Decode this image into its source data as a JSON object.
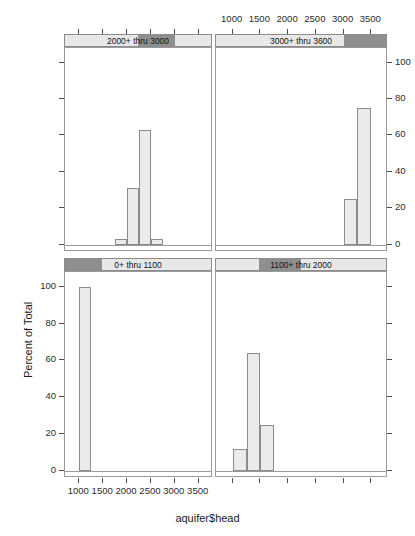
{
  "chart_data": {
    "type": "bar",
    "title": "",
    "xlabel": "aquifer$head",
    "ylabel": "Percent of Total",
    "layout": "lattice conditioned histogram, 2 rows x 2 columns",
    "xlim": [
      700,
      3800
    ],
    "ylim": [
      -4,
      108
    ],
    "xticks": [
      1000,
      1500,
      2000,
      2500,
      3000,
      3500
    ],
    "yticks": [
      0,
      20,
      40,
      60,
      80,
      100
    ],
    "grid": false,
    "legend": "none",
    "bin_width": 250,
    "panels": [
      {
        "id": "panel-top-left",
        "strip_label": "2000+ thru 3000",
        "strip_shade_start_pct": 50,
        "strip_shade_end_pct": 75,
        "row": 0,
        "col": 0,
        "bins": [
          {
            "x0": 1750,
            "x1": 2000,
            "value": 3
          },
          {
            "x0": 2000,
            "x1": 2250,
            "value": 31
          },
          {
            "x0": 2250,
            "x1": 2500,
            "value": 63
          },
          {
            "x0": 2500,
            "x1": 2750,
            "value": 3
          }
        ]
      },
      {
        "id": "panel-top-right",
        "strip_label": "3000+ thru 3600",
        "strip_shade_start_pct": 75,
        "strip_shade_end_pct": 100,
        "row": 0,
        "col": 1,
        "bins": [
          {
            "x0": 3000,
            "x1": 3250,
            "value": 25
          },
          {
            "x0": 3250,
            "x1": 3500,
            "value": 75
          }
        ]
      },
      {
        "id": "panel-bottom-left",
        "strip_label": "0+ thru 1100",
        "strip_shade_start_pct": 0,
        "strip_shade_end_pct": 25,
        "row": 1,
        "col": 0,
        "bins": [
          {
            "x0": 1000,
            "x1": 1250,
            "value": 100
          }
        ]
      },
      {
        "id": "panel-bottom-right",
        "strip_label": "1100+ thru 2000",
        "strip_shade_start_pct": 25,
        "strip_shade_end_pct": 50,
        "row": 1,
        "col": 1,
        "bins": [
          {
            "x0": 1000,
            "x1": 1250,
            "value": 12
          },
          {
            "x0": 1250,
            "x1": 1500,
            "value": 64
          },
          {
            "x0": 1500,
            "x1": 1750,
            "value": 25
          }
        ]
      }
    ]
  },
  "axes": {
    "x_title": "aquifer$head",
    "y_title": "Percent of Total",
    "x_tick_labels_top": [
      "1000",
      "1500",
      "2000",
      "2500",
      "3000",
      "3500"
    ],
    "x_tick_labels_bottom": [
      "1000",
      "1500",
      "2000",
      "2500",
      "3000",
      "3500"
    ],
    "y_tick_labels_right": [
      "0",
      "20",
      "40",
      "60",
      "80",
      "100"
    ],
    "y_tick_labels_left": [
      "0",
      "20",
      "40",
      "60",
      "80",
      "100"
    ]
  },
  "strips": {
    "top_left": "2000+ thru 3000",
    "top_right": "3000+ thru 3600",
    "bottom_left": "0+ thru 1100",
    "bottom_right": "1100+ thru 2000"
  },
  "colors": {
    "bar_fill": "#ebebeb",
    "bar_border": "#8c8c8c",
    "strip_bg": "#e8e8e8",
    "strip_shade": "#8f8f8f",
    "axis": "#4d4d4d",
    "panel_border": "#9a9a9a",
    "background": "#ffffff"
  }
}
